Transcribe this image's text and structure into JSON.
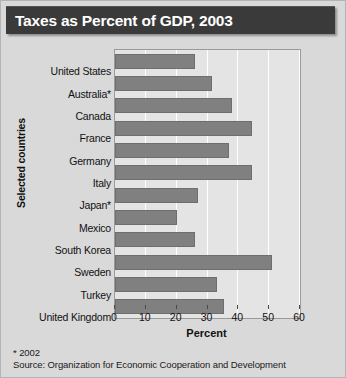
{
  "title": "Taxes as Percent of GDP, 2003",
  "footnotes": [
    "* 2002",
    "Source: Organization for Economic Cooperation and Development"
  ],
  "colors": {
    "title_bar": "#3a3a3a",
    "title_text": "#ffffff",
    "bar_fill": "#808080",
    "plot_background": "#e4e4e4",
    "gridline": "#ffffff",
    "page_background": "#d9d9d9"
  },
  "chart_data": {
    "type": "bar",
    "orientation": "horizontal",
    "title": "Taxes as Percent of GDP, 2003",
    "xlabel": "Percent",
    "ylabel": "Selected countries",
    "xlim": [
      0,
      60
    ],
    "xticks": [
      0,
      10,
      20,
      30,
      40,
      50,
      60
    ],
    "xtick_labels": [
      "0",
      "10",
      "20",
      "30",
      "40",
      "50",
      "60"
    ],
    "grid": true,
    "legend": false,
    "categories": [
      "United States",
      "Australia*",
      "Canada",
      "France",
      "Germany",
      "Italy",
      "Japan*",
      "Mexico",
      "South Korea",
      "Sweden",
      "Turkey",
      "United Kingdom"
    ],
    "values": [
      26,
      31.5,
      38,
      44.5,
      37,
      44.5,
      27,
      20,
      26,
      51,
      33,
      35.5
    ],
    "value_unit": "percent of GDP"
  }
}
